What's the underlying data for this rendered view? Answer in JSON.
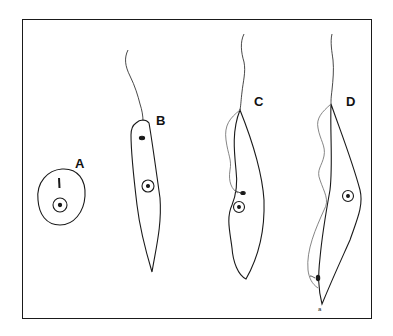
{
  "figure": {
    "panels": [
      {
        "id": "A",
        "label": "A",
        "description": "rounded form with nucleus and short flagellar rudiment"
      },
      {
        "id": "B",
        "label": "B",
        "description": "elongated form, anterior flagellum, kinetoplast near anterior end"
      },
      {
        "id": "C",
        "label": "C",
        "description": "elongated form with undulating membrane, kinetoplast beside nucleus"
      },
      {
        "id": "D",
        "label": "D",
        "description": "elongated form with long undulating membrane, posterior kinetoplast"
      }
    ],
    "annotations": {
      "d_small_mark": "a"
    },
    "colors": {
      "line": "#1a1a1a",
      "background": "#ffffff",
      "membrane": "#555555"
    }
  }
}
